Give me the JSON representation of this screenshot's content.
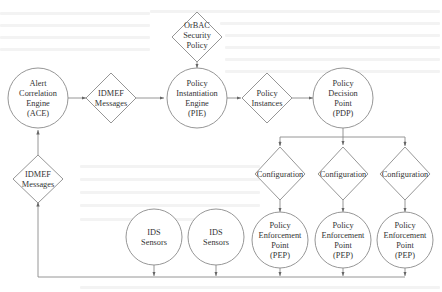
{
  "diagram": {
    "title": "",
    "nodes": {
      "ace": {
        "shape": "circle",
        "lines": [
          "Alert",
          "Correlation",
          "Engine",
          "(ACE)"
        ]
      },
      "idmef_top": {
        "shape": "diamond",
        "lines": [
          "IDMEF",
          "Messages"
        ]
      },
      "orbac": {
        "shape": "diamond",
        "lines": [
          "OrBAC",
          "Security",
          "Policy"
        ]
      },
      "pie": {
        "shape": "circle",
        "lines": [
          "Policy",
          "Instantiation",
          "Engine",
          "(PIE)"
        ]
      },
      "instances": {
        "shape": "diamond",
        "lines": [
          "Policy",
          "Instances"
        ]
      },
      "pdp": {
        "shape": "circle",
        "lines": [
          "Policy",
          "Decision",
          "Point",
          "(PDP)"
        ]
      },
      "config1": {
        "shape": "diamond",
        "lines": [
          "Configuration"
        ]
      },
      "config2": {
        "shape": "diamond",
        "lines": [
          "Configuration"
        ]
      },
      "config3": {
        "shape": "diamond",
        "lines": [
          "Configuration"
        ]
      },
      "pep1": {
        "shape": "circle",
        "lines": [
          "Policy",
          "Enforcement",
          "Point",
          "(PEP)"
        ]
      },
      "pep2": {
        "shape": "circle",
        "lines": [
          "Policy",
          "Enforcement",
          "Point",
          "(PEP)"
        ]
      },
      "pep3": {
        "shape": "circle",
        "lines": [
          "Policy",
          "Enforcement",
          "Point",
          "(PEP)"
        ]
      },
      "ids1": {
        "shape": "circle",
        "lines": [
          "IDS",
          "Sensors"
        ]
      },
      "ids2": {
        "shape": "circle",
        "lines": [
          "IDS",
          "Sensors"
        ]
      },
      "idmef_bottom": {
        "shape": "diamond",
        "lines": [
          "IDMEF",
          "Messages"
        ]
      }
    },
    "edges": [
      {
        "from": "ace",
        "to": "idmef_top"
      },
      {
        "from": "idmef_top",
        "to": "pie"
      },
      {
        "from": "orbac",
        "to": "pie"
      },
      {
        "from": "pie",
        "to": "instances"
      },
      {
        "from": "instances",
        "to": "pdp"
      },
      {
        "from": "pdp",
        "to": "config1"
      },
      {
        "from": "pdp",
        "to": "config2"
      },
      {
        "from": "pdp",
        "to": "config3"
      },
      {
        "from": "config1",
        "to": "pep1"
      },
      {
        "from": "config2",
        "to": "pep2"
      },
      {
        "from": "config3",
        "to": "pep3"
      },
      {
        "from": "ids1",
        "to": "bus"
      },
      {
        "from": "ids2",
        "to": "bus"
      },
      {
        "from": "pep1",
        "to": "bus"
      },
      {
        "from": "pep2",
        "to": "bus"
      },
      {
        "from": "pep3",
        "to": "bus"
      },
      {
        "from": "bus",
        "to": "idmef_bottom"
      },
      {
        "from": "idmef_bottom",
        "to": "ace"
      }
    ]
  }
}
